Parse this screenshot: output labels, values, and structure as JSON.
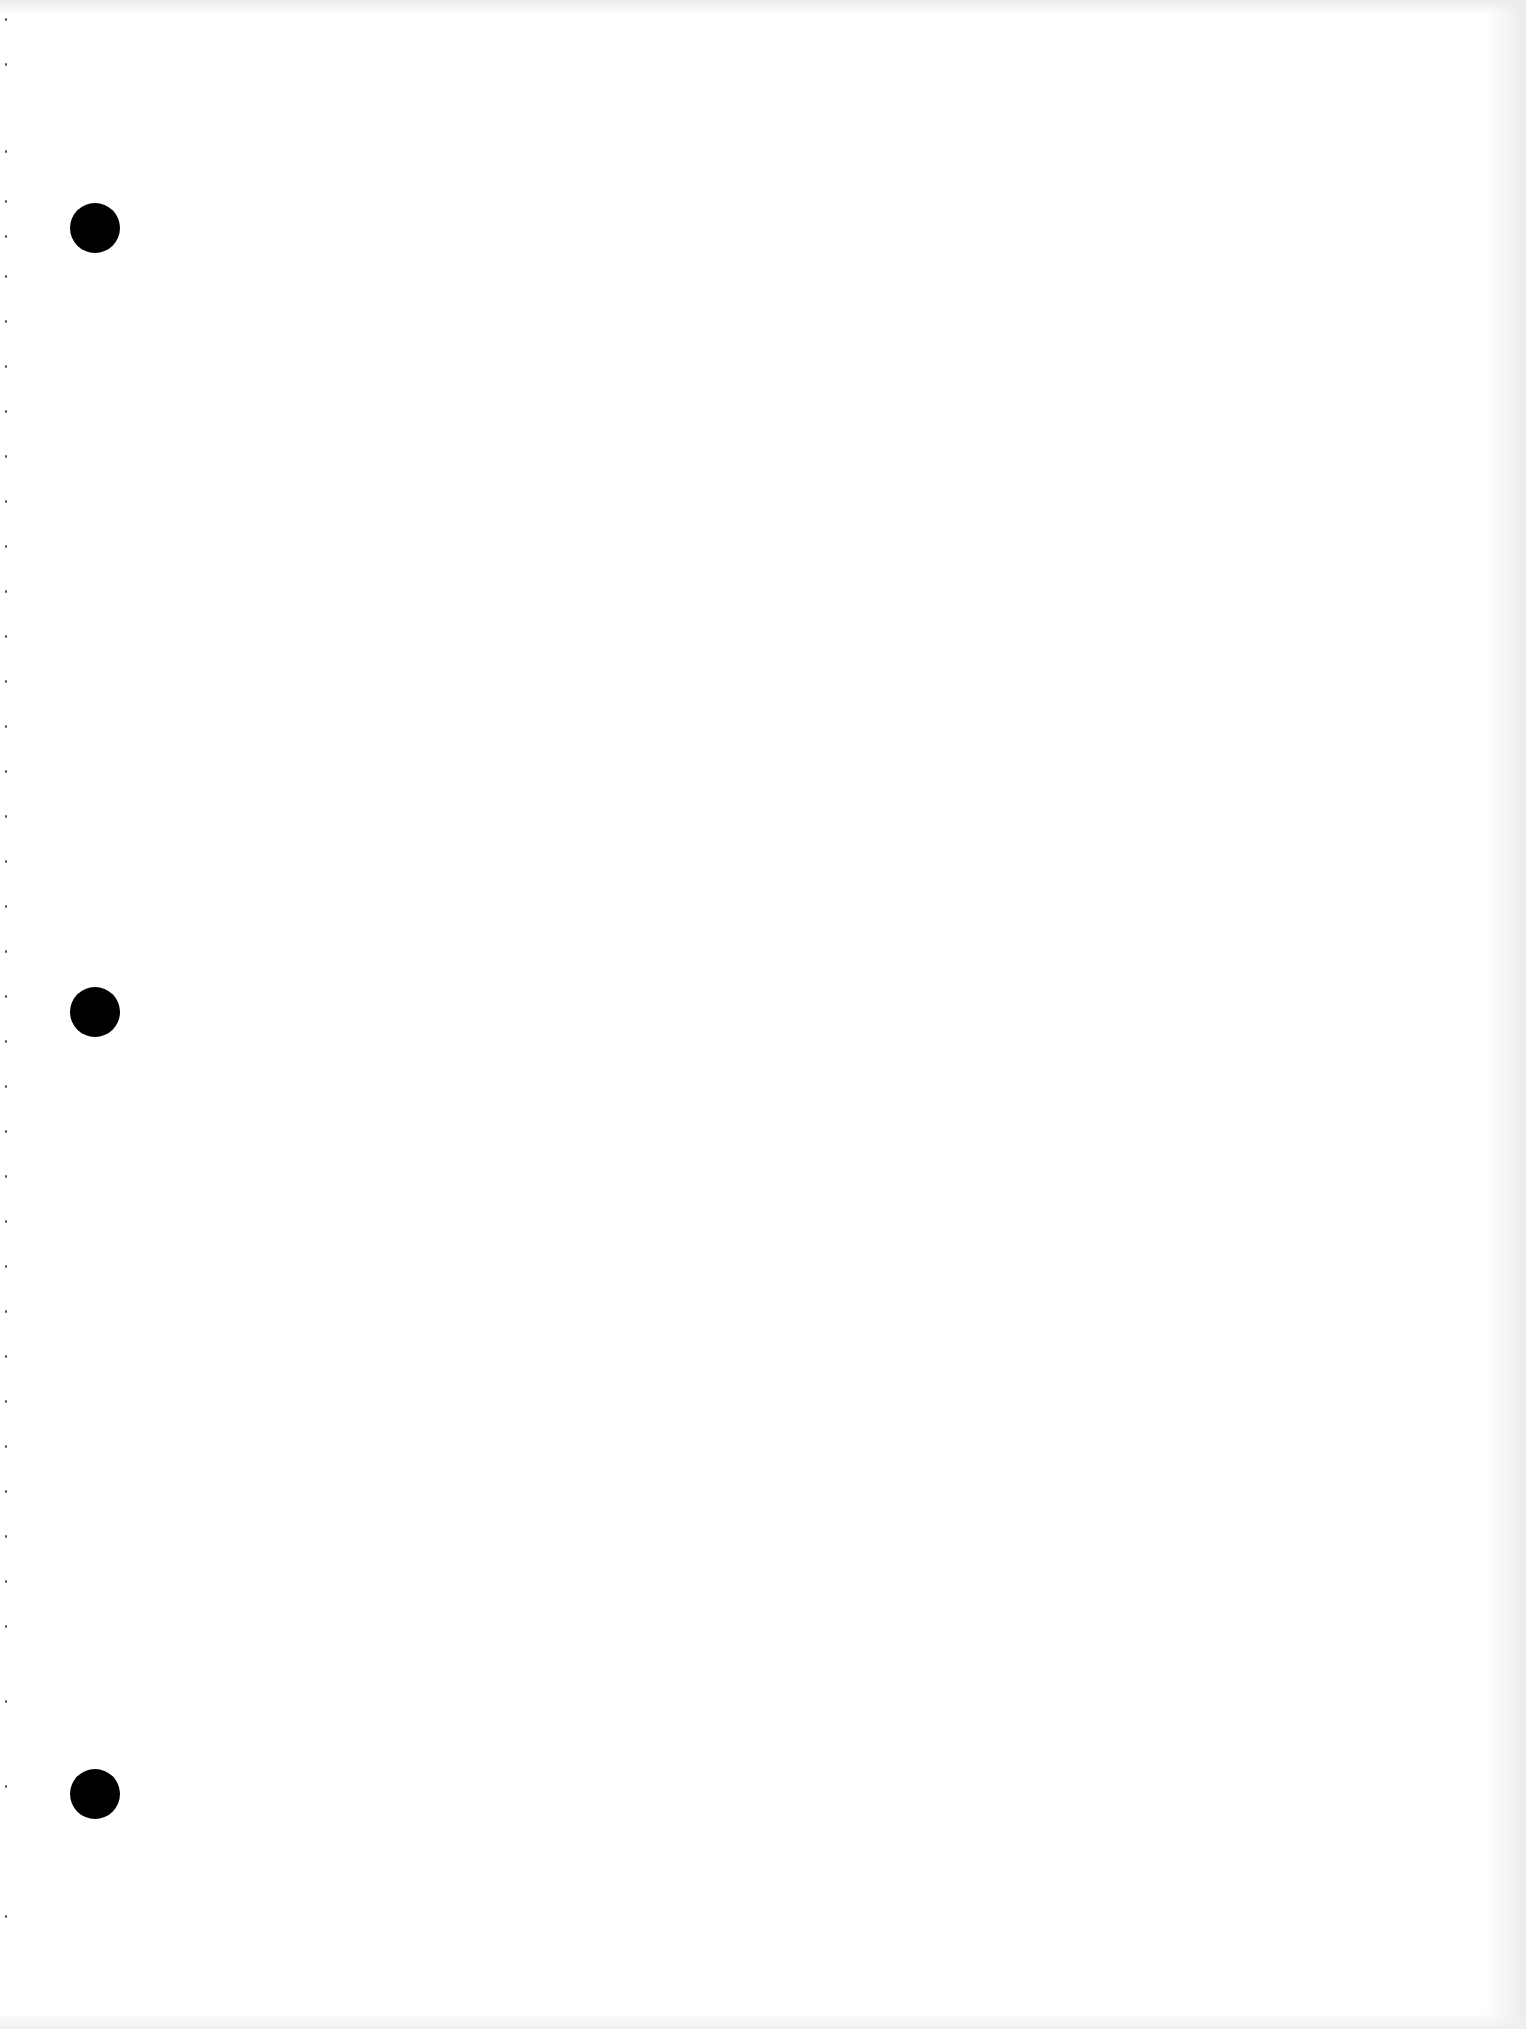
{
  "document": {
    "type": "blank-scanned-page",
    "background_color": "#ffffff",
    "text_content": "",
    "punch_holes": [
      {
        "cx": 95,
        "cy": 228,
        "diameter": 50,
        "color": "#000000"
      },
      {
        "cx": 95,
        "cy": 1012,
        "diameter": 50,
        "color": "#000000"
      },
      {
        "cx": 95,
        "cy": 1794,
        "diameter": 50,
        "color": "#000000"
      }
    ],
    "perforation_mark_ys": [
      18,
      63,
      150,
      200,
      235,
      275,
      320,
      365,
      410,
      455,
      500,
      545,
      590,
      635,
      680,
      725,
      770,
      815,
      860,
      905,
      950,
      995,
      1040,
      1085,
      1130,
      1175,
      1220,
      1265,
      1310,
      1355,
      1400,
      1445,
      1490,
      1535,
      1580,
      1625,
      1700,
      1785,
      1915
    ]
  }
}
